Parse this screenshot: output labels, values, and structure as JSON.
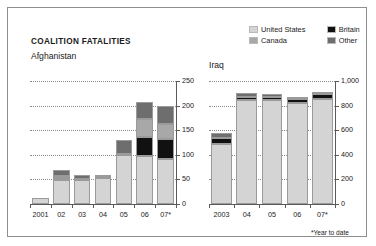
{
  "panel": {
    "title": "COALITION FATALITIES",
    "footnote": "*Year to date"
  },
  "legend": {
    "items": [
      {
        "label": "United States",
        "color": "#d4d4d4"
      },
      {
        "label": "Britain",
        "color": "#111111"
      },
      {
        "label": "Canada",
        "color": "#a8a8a8"
      },
      {
        "label": "Other",
        "color": "#6e6e6e"
      }
    ]
  },
  "chart_data": [
    {
      "type": "bar",
      "title": "Afghanistan",
      "xlabel": "",
      "ylabel": "",
      "ylim": [
        0,
        250
      ],
      "yticks": [
        "0",
        "50",
        "100",
        "150",
        "200",
        "250"
      ],
      "ytickvalues": [
        0,
        50,
        100,
        150,
        200,
        250
      ],
      "grid": true,
      "stacked": true,
      "legend_position": "top-right",
      "categories": [
        "2001",
        "02",
        "03",
        "04",
        "05",
        "06",
        "07*"
      ],
      "series": [
        {
          "name": "United States",
          "color": "#d4d4d4",
          "values": [
            12,
            49,
            48,
            52,
            99,
            98,
            91
          ]
        },
        {
          "name": "Britain",
          "color": "#111111",
          "values": [
            0,
            3,
            0,
            1,
            1,
            39,
            41
          ]
        },
        {
          "name": "Canada",
          "color": "#a8a8a8",
          "values": [
            0,
            4,
            2,
            1,
            1,
            36,
            30
          ]
        },
        {
          "name": "Other",
          "color": "#6e6e6e",
          "values": [
            0,
            13,
            8,
            4,
            30,
            34,
            38
          ]
        }
      ],
      "totals": [
        12,
        69,
        58,
        58,
        131,
        207,
        200
      ]
    },
    {
      "type": "bar",
      "title": "Iraq",
      "xlabel": "",
      "ylabel": "",
      "ylim": [
        0,
        1000
      ],
      "yticks": [
        "0",
        "200",
        "400",
        "600",
        "800",
        "1,000"
      ],
      "ytickvalues": [
        0,
        200,
        400,
        600,
        800,
        1000
      ],
      "grid": true,
      "stacked": true,
      "categories": [
        "2003",
        "04",
        "05",
        "06",
        "07*"
      ],
      "series": [
        {
          "name": "United States",
          "color": "#d4d4d4",
          "values": [
            486,
            849,
            846,
            822,
            853
          ]
        },
        {
          "name": "Britain",
          "color": "#111111",
          "values": [
            53,
            22,
            23,
            29,
            39
          ]
        },
        {
          "name": "Canada",
          "color": "#a8a8a8",
          "values": [
            0,
            0,
            0,
            0,
            0
          ]
        },
        {
          "name": "Other",
          "color": "#6e6e6e",
          "values": [
            41,
            34,
            28,
            21,
            18
          ]
        }
      ],
      "totals": [
        580,
        905,
        897,
        872,
        910
      ]
    }
  ]
}
